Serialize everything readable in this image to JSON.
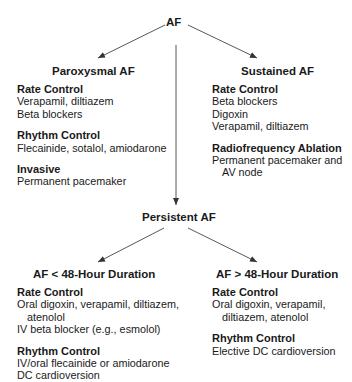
{
  "root": {
    "label": "AF"
  },
  "paroxysmal": {
    "title": "Paroxysmal AF",
    "sections": [
      {
        "heading": "Rate Control",
        "lines": [
          "Verapamil, diltiazem",
          "Beta blockers"
        ]
      },
      {
        "heading": "Rhythm Control",
        "lines": [
          "Flecainide, sotalol, amiodarone"
        ]
      },
      {
        "heading": "Invasive",
        "lines": [
          "Permanent pacemaker"
        ]
      }
    ]
  },
  "sustained": {
    "title": "Sustained AF",
    "sections": [
      {
        "heading": "Rate Control",
        "lines": [
          "Beta blockers",
          "Digoxin",
          "Verapamil, diltiazem"
        ]
      },
      {
        "heading": "Radiofrequency Ablation",
        "lines": [
          "Permanent pacemaker and",
          "AV node"
        ]
      }
    ]
  },
  "persistent": {
    "label": "Persistent AF"
  },
  "lt48": {
    "title": "AF < 48-Hour Duration",
    "sections": [
      {
        "heading": "Rate Control",
        "lines": [
          "Oral digoxin, verapamil, diltiazem,",
          "atenolol",
          "IV beta blocker (e.g., esmolol)"
        ]
      },
      {
        "heading": "Rhythm Control",
        "lines": [
          "IV/oral flecainide or amiodarone",
          "DC cardioversion"
        ]
      }
    ]
  },
  "gt48": {
    "title": "AF > 48-Hour Duration",
    "sections": [
      {
        "heading": "Rate Control",
        "lines": [
          "Oral digoxin, verapamil,",
          "diltiazem, atenolol"
        ]
      },
      {
        "heading": "Rhythm Control",
        "lines": [
          "Elective DC cardioversion"
        ]
      }
    ]
  },
  "colors": {
    "text": "#1a1a1a",
    "line": "#333333"
  }
}
